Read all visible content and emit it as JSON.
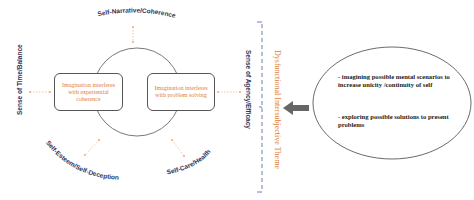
{
  "diagram": {
    "top_label": "Self-Narrative/Coherence",
    "left_label": "Sense of Time/Balance",
    "right_label": "Sense of Agency/Efficacy",
    "bottom_left_label": "Self-Esteem/Self-Deception",
    "bottom_right_label": "Self-Care/Health",
    "left_box": "Imagination interferes with experiential coherence",
    "right_box": "Imagination interferes with problem solving",
    "theme_label": "Dysfunctional Intersubjective Theme",
    "ellipse": {
      "item1": "- imagining possible mental scenarios to increase unicity /continuity of self",
      "item2": "- exploring possible solutions to present problems"
    },
    "colors": {
      "accent_orange": "#e07b39",
      "label_navy": "#2e3560",
      "bracket_blue": "#5a6fb0",
      "arrow_gray": "#666666"
    }
  }
}
